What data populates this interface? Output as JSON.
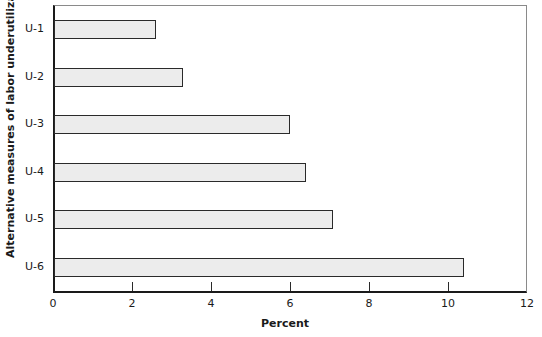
{
  "chart_data": {
    "type": "bar",
    "orientation": "horizontal",
    "title": "",
    "xlabel": "Percent",
    "ylabel": "Alternative measures of labor underutilization",
    "categories": [
      "U-1",
      "U-2",
      "U-3",
      "U-4",
      "U-5",
      "U-6"
    ],
    "values": [
      2.6,
      3.3,
      6.0,
      6.4,
      7.1,
      10.4
    ],
    "xlim": [
      0,
      12
    ],
    "xticks": [
      0,
      2,
      4,
      6,
      8,
      10,
      12
    ],
    "grid": false,
    "legend": null,
    "bar_color": "#ececec",
    "bar_border_color": "#2a2a2a"
  }
}
